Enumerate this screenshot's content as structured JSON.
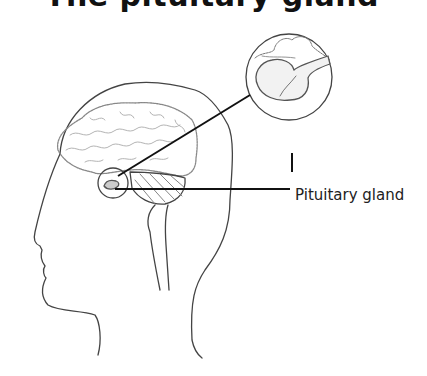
{
  "diagram": {
    "title": "The pituitary gland",
    "labels": [
      {
        "text": "Pituitary gland"
      }
    ],
    "parts": [
      "head-profile",
      "brain",
      "cerebellum",
      "brainstem",
      "pituitary-gland",
      "magnified-inset"
    ],
    "colors": {
      "line": "#333333",
      "background": "#ffffff",
      "text": "#222222"
    }
  }
}
